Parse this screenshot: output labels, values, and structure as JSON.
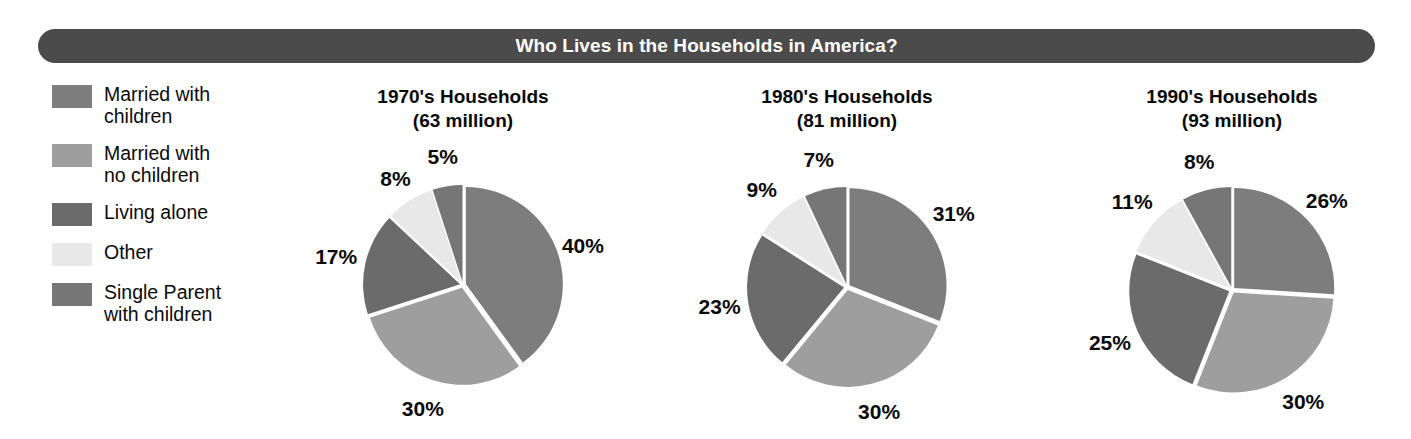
{
  "banner": {
    "title": "Who Lives in the Households in America?",
    "color": "#4b4b4b",
    "text_color": "#ffffff"
  },
  "legend": {
    "items": [
      {
        "label": "Married with\nchildren",
        "color": "#7d7d7d",
        "swatch_name": "legend-swatch-married-with-children"
      },
      {
        "label": "Married with\nno children",
        "color": "#9e9e9e",
        "swatch_name": "legend-swatch-married-no-children"
      },
      {
        "label": "Living alone",
        "color": "#6b6b6b",
        "swatch_name": "legend-swatch-living-alone"
      },
      {
        "label": "Other",
        "color": "#e8e8e8",
        "swatch_name": "legend-swatch-other"
      },
      {
        "label": "Single Parent\nwith children",
        "color": "#767676",
        "swatch_name": "legend-swatch-single-parent"
      }
    ]
  },
  "charts": [
    {
      "title": "1970's Households\n(63 million)",
      "labels": [
        "40%",
        "30%",
        "17%",
        "8%",
        "5%"
      ]
    },
    {
      "title": "1980's Households\n(81 million)",
      "labels": [
        "31%",
        "30%",
        "23%",
        "9%",
        "7%"
      ]
    },
    {
      "title": "1990's Households\n(93 million)",
      "labels": [
        "26%",
        "30%",
        "25%",
        "11%",
        "8%"
      ]
    }
  ],
  "chart_data": {
    "type": "pie",
    "title": "Who Lives in the Households in America?",
    "categories": [
      "Married with children",
      "Married with no children",
      "Living alone",
      "Other",
      "Single Parent with children"
    ],
    "colors": [
      "#7d7d7d",
      "#9e9e9e",
      "#6b6b6b",
      "#e8e8e8",
      "#767676"
    ],
    "legend_position": "left",
    "charts": [
      {
        "name": "1970's Households",
        "title": "1970's Households\n(63 million)",
        "total": "63 million",
        "total_value": 63,
        "unit": "million households",
        "values": [
          40,
          30,
          17,
          8,
          5
        ],
        "labels": [
          "40%",
          "30%",
          "17%",
          "8%",
          "5%"
        ],
        "center": [
          463,
          285
        ],
        "radius": 97
      },
      {
        "name": "1980's Households",
        "title": "1980's Households\n(81 million)",
        "total": "81 million",
        "total_value": 81,
        "unit": "million households",
        "values": [
          31,
          30,
          23,
          9,
          7
        ],
        "labels": [
          "31%",
          "30%",
          "23%",
          "9%",
          "7%"
        ],
        "center": [
          847,
          287
        ],
        "radius": 97
      },
      {
        "name": "1990's Households",
        "title": "1990's Households\n(93 million)",
        "total": "93 million",
        "total_value": 93,
        "unit": "million households",
        "values": [
          26,
          30,
          25,
          11,
          8
        ],
        "labels": [
          "26%",
          "30%",
          "25%",
          "11%",
          "8%"
        ],
        "center": [
          1232,
          290
        ],
        "radius": 100
      }
    ]
  }
}
